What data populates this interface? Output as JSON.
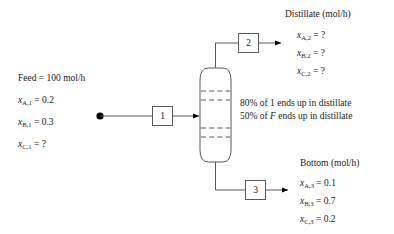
{
  "diagram": {
    "line_color": "#58585a",
    "text_color": "#1a1a1a",
    "background": "#ffffff"
  },
  "feed": {
    "heading": "Feed = 100 mol/h",
    "specs": [
      {
        "var": "x",
        "sub": "A,1",
        "eq": "= 0.2"
      },
      {
        "var": "x",
        "sub": "B,1",
        "eq": "= 0.3"
      },
      {
        "var": "x",
        "sub": "C,1",
        "eq": "= ?"
      }
    ]
  },
  "distillate": {
    "heading": "Distillate (mol/h)",
    "specs": [
      {
        "var": "x",
        "sub": "A,2",
        "eq": "= ?"
      },
      {
        "var": "x",
        "sub": "B,2",
        "eq": "= ?"
      },
      {
        "var": "x",
        "sub": "C,2",
        "eq": "= ?"
      }
    ]
  },
  "bottom": {
    "heading": "Bottom (mol/h)",
    "specs": [
      {
        "var": "x",
        "sub": "A,3",
        "eq": "= 0.1"
      },
      {
        "var": "x",
        "sub": "B,3",
        "eq": "= 0.7"
      },
      {
        "var": "x",
        "sub": "C,3",
        "eq": "= 0.2"
      }
    ]
  },
  "constraints": {
    "line1_pre": "80% of 1 ends up in distillate",
    "line2_pre": "50% of ",
    "line2_var": "F",
    "line2_post": " ends up in distillate"
  },
  "streams": {
    "feed_box": "1",
    "distillate_box": "2",
    "bottom_box": "3"
  },
  "column": {
    "tray_count": 4,
    "label": "distillation-column"
  }
}
